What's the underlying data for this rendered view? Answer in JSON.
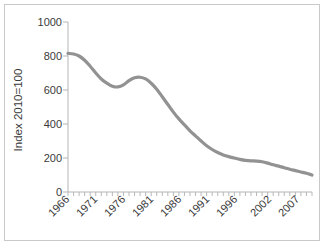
{
  "chart_data": {
    "type": "line",
    "title": "",
    "subtitle": "",
    "xlabel": "",
    "ylabel": "Index 2010=100",
    "ylim": [
      0,
      1000
    ],
    "xlim": [
      1966,
      2010
    ],
    "grid": false,
    "legend": null,
    "legend_position": "none",
    "series_color": "#929292",
    "x": [
      1966,
      1967,
      1968,
      1969,
      1970,
      1971,
      1972,
      1973,
      1974,
      1975,
      1976,
      1977,
      1978,
      1979,
      1980,
      1981,
      1982,
      1983,
      1984,
      1985,
      1986,
      1987,
      1988,
      1989,
      1990,
      1991,
      1992,
      1993,
      1994,
      1995,
      1996,
      1997,
      1998,
      1999,
      2000,
      2001,
      2002,
      2003,
      2004,
      2005,
      2006,
      2007,
      2008,
      2009,
      2010
    ],
    "series": [
      {
        "name": "Index 2010=100",
        "values": [
          815,
          812,
          800,
          775,
          740,
          700,
          665,
          640,
          622,
          618,
          630,
          655,
          672,
          675,
          665,
          640,
          605,
          560,
          515,
          470,
          430,
          395,
          360,
          330,
          300,
          272,
          250,
          232,
          218,
          208,
          200,
          192,
          186,
          183,
          182,
          178,
          170,
          160,
          152,
          143,
          134,
          126,
          118,
          110,
          100
        ]
      }
    ],
    "y_ticks": [
      0,
      200,
      400,
      600,
      800,
      1000
    ],
    "y_tick_labels": [
      "0",
      "200",
      "400",
      "600",
      "800",
      "1000"
    ],
    "x_ticks": [
      1966,
      1971,
      1976,
      1981,
      1986,
      1991,
      1996,
      2002,
      2007
    ],
    "x_tick_labels": [
      "1966",
      "1971",
      "1976",
      "1981",
      "1986",
      "1991",
      "1996",
      "2002",
      "2007"
    ],
    "x_tick_rotation": 45
  }
}
